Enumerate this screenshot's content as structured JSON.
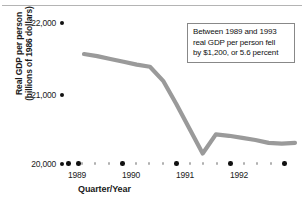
{
  "chart_data": {
    "type": "line",
    "title": "",
    "xlabel": "Quarter/Year",
    "ylabel": "Real GDP per person (billions of 1986 dollars)",
    "ylabel_lines": [
      "Real GDP per person",
      "(billions of 1986 dollars)"
    ],
    "ylim": [
      20000,
      22000
    ],
    "yticks": [
      20000,
      21000,
      22000
    ],
    "ytick_labels": [
      "20,000",
      "21,000",
      "22,000"
    ],
    "xtick_labels": [
      "1989",
      "1990",
      "1991",
      "1992"
    ],
    "grid": false,
    "legend": null,
    "line_color": "#9a9a9a",
    "x": [
      "1988Q4",
      "1989Q1",
      "1989Q2",
      "1989Q3",
      "1989Q4",
      "1990Q1",
      "1990Q2",
      "1990Q3",
      "1990Q4",
      "1991Q1",
      "1991Q2",
      "1991Q3",
      "1991Q4",
      "1992Q1",
      "1992Q2",
      "1992Q3",
      "1992Q4"
    ],
    "values": [
      21560,
      21530,
      21490,
      21450,
      21410,
      21380,
      21180,
      20850,
      20500,
      20150,
      20420,
      20400,
      20370,
      20340,
      20300,
      20290,
      20300
    ],
    "annotations": [
      {
        "text": "Between 1989 and 1993 real GDP per person fell by $1,200, or 5.6 percent",
        "lines": [
          "Between 1989 and 1993",
          "real GDP per person fell",
          "by $1,200, or 5.6 percent"
        ]
      }
    ]
  },
  "axes": {
    "y": {
      "title_lines": [
        "Real GDP per person",
        "(billions of 1986 dollars)"
      ],
      "ticks": [
        {
          "label": "22,000"
        },
        {
          "label": "21,000"
        },
        {
          "label": "20,000"
        }
      ]
    },
    "x": {
      "title": "Quarter/Year",
      "ticks": [
        {
          "label": "1989"
        },
        {
          "label": "1990"
        },
        {
          "label": "1991"
        },
        {
          "label": "1992"
        }
      ]
    }
  },
  "annotation": {
    "line1": "Between 1989 and 1993",
    "line2": "real GDP per person fell",
    "line3": "by $1,200, or 5.6 percent"
  }
}
